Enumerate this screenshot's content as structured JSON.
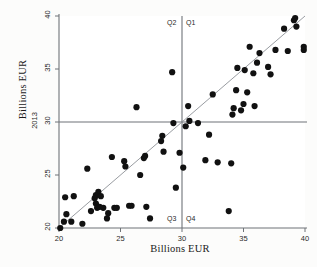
{
  "chart_data": {
    "type": "scatter",
    "title": "",
    "xlabel": "Billions EUR",
    "ylabel": "Billions EUR",
    "yaxis_series_name": "2013",
    "xlim": [
      20,
      40
    ],
    "ylim": [
      20,
      40
    ],
    "xticks": [
      20,
      25,
      30,
      35,
      40
    ],
    "yticks": [
      20,
      25,
      30,
      35,
      40
    ],
    "xtick_labels": [
      "20",
      "25",
      "30",
      "35",
      "40"
    ],
    "ytick_labels": [
      "20",
      "25",
      "30",
      "35",
      "40"
    ],
    "grid": false,
    "legend_position": "none",
    "reference_line": {
      "type": "identity",
      "from": [
        20,
        20
      ],
      "to": [
        40,
        40
      ]
    },
    "crosshair": {
      "x": 30,
      "y": 30
    },
    "quadrant_labels": [
      {
        "name": "Q1",
        "position": "top-right"
      },
      {
        "name": "Q2",
        "position": "top-left"
      },
      {
        "name": "Q3",
        "position": "bottom-left"
      },
      {
        "name": "Q4",
        "position": "bottom-right"
      }
    ],
    "marker": {
      "shape": "circle",
      "color": "#111111",
      "size": 3.1
    },
    "points": [
      [
        20.1,
        20.0
      ],
      [
        20.4,
        20.6
      ],
      [
        20.5,
        22.9
      ],
      [
        20.6,
        21.3
      ],
      [
        21.0,
        20.6
      ],
      [
        21.2,
        23.0
      ],
      [
        21.9,
        20.4
      ],
      [
        22.3,
        25.6
      ],
      [
        22.6,
        21.6
      ],
      [
        22.9,
        22.8
      ],
      [
        23.0,
        22.3
      ],
      [
        23.0,
        23.1
      ],
      [
        23.1,
        21.9
      ],
      [
        23.2,
        23.4
      ],
      [
        23.2,
        22.0
      ],
      [
        23.3,
        22.0
      ],
      [
        23.4,
        23.0
      ],
      [
        23.6,
        21.9
      ],
      [
        23.9,
        20.9
      ],
      [
        24.0,
        21.4
      ],
      [
        24.3,
        26.7
      ],
      [
        24.5,
        21.9
      ],
      [
        24.7,
        21.9
      ],
      [
        25.3,
        26.3
      ],
      [
        25.4,
        25.8
      ],
      [
        25.7,
        22.1
      ],
      [
        25.9,
        22.1
      ],
      [
        26.3,
        31.4
      ],
      [
        26.6,
        25.0
      ],
      [
        26.9,
        26.6
      ],
      [
        27.0,
        26.8
      ],
      [
        27.1,
        22.0
      ],
      [
        27.4,
        20.9
      ],
      [
        28.3,
        28.2
      ],
      [
        28.4,
        28.7
      ],
      [
        28.5,
        27.2
      ],
      [
        29.2,
        34.7
      ],
      [
        29.3,
        29.9
      ],
      [
        29.5,
        23.8
      ],
      [
        29.8,
        27.1
      ],
      [
        30.1,
        25.7
      ],
      [
        30.3,
        29.6
      ],
      [
        30.5,
        31.5
      ],
      [
        30.6,
        30.1
      ],
      [
        31.3,
        29.9
      ],
      [
        31.9,
        26.4
      ],
      [
        32.2,
        28.8
      ],
      [
        32.5,
        32.6
      ],
      [
        32.9,
        26.2
      ],
      [
        33.8,
        21.6
      ],
      [
        34.0,
        26.1
      ],
      [
        34.1,
        30.7
      ],
      [
        34.2,
        31.3
      ],
      [
        34.4,
        33.0
      ],
      [
        34.5,
        35.1
      ],
      [
        34.8,
        31.1
      ],
      [
        35.0,
        31.7
      ],
      [
        35.1,
        34.9
      ],
      [
        35.3,
        32.8
      ],
      [
        35.5,
        37.1
      ],
      [
        35.8,
        34.6
      ],
      [
        35.9,
        31.5
      ],
      [
        36.1,
        35.6
      ],
      [
        36.3,
        36.5
      ],
      [
        37.0,
        35.2
      ],
      [
        37.2,
        34.5
      ],
      [
        37.6,
        36.8
      ],
      [
        38.3,
        38.8
      ],
      [
        38.6,
        36.7
      ],
      [
        39.1,
        39.6
      ],
      [
        39.2,
        39.8
      ],
      [
        39.3,
        39.0
      ],
      [
        39.9,
        37.1
      ],
      [
        39.9,
        36.8
      ]
    ]
  }
}
